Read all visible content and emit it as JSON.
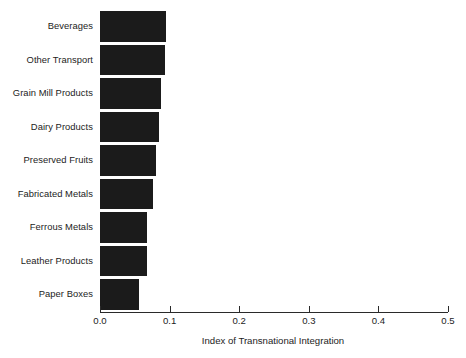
{
  "chart_data": {
    "type": "bar",
    "orientation": "horizontal",
    "title": "",
    "xlabel": "Index of Transnational Integration",
    "ylabel": "",
    "xlim": [
      0.0,
      0.5
    ],
    "xticks": [
      "0.0",
      "0.1",
      "0.2",
      "0.3",
      "0.4",
      "0.5"
    ],
    "xtick_values": [
      0.0,
      0.1,
      0.2,
      0.3,
      0.4,
      0.5
    ],
    "grid": false,
    "legend": null,
    "bar_color": "#1b1b1b",
    "categories": [
      "Beverages",
      "Other Transport",
      "Grain Mill Products",
      "Dairy Products",
      "Preserved Fruits",
      "Fabricated Metals",
      "Ferrous Metals",
      "Leather Products",
      "Paper Boxes"
    ],
    "values": [
      0.095,
      0.093,
      0.088,
      0.085,
      0.08,
      0.076,
      0.068,
      0.067,
      0.056
    ]
  }
}
